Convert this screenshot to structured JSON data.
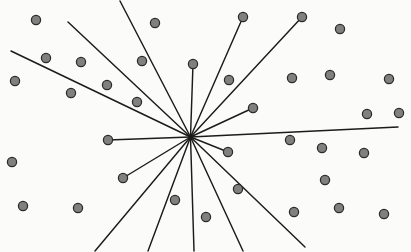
{
  "figure": {
    "type": "scatter-with-radial-lines",
    "width": 411,
    "height": 252,
    "background_color": "#fbfbfa",
    "dot_fill_color": "#808080",
    "dot_stroke_color": "#2b2b2b",
    "line_color": "#1b1b1b",
    "line_width": 1.45,
    "dot_radius": 4.6
  },
  "chart_data": {
    "type": "scatter",
    "title": "",
    "xlabel": "",
    "ylabel": "",
    "xlim": [
      0,
      411
    ],
    "ylim": [
      0,
      252
    ],
    "grid": false,
    "legend": null,
    "annotations": [],
    "hub": {
      "x": 190.5,
      "y": 137.0,
      "label": "convergence-point"
    },
    "points": [
      {
        "x": 36,
        "y": 20
      },
      {
        "x": 155,
        "y": 23
      },
      {
        "x": 243,
        "y": 17
      },
      {
        "x": 302,
        "y": 17
      },
      {
        "x": 340,
        "y": 29
      },
      {
        "x": 46,
        "y": 58
      },
      {
        "x": 81,
        "y": 62
      },
      {
        "x": 142,
        "y": 61
      },
      {
        "x": 15,
        "y": 81
      },
      {
        "x": 71,
        "y": 93
      },
      {
        "x": 107,
        "y": 85
      },
      {
        "x": 229,
        "y": 80
      },
      {
        "x": 292,
        "y": 78
      },
      {
        "x": 330,
        "y": 75
      },
      {
        "x": 389,
        "y": 79
      },
      {
        "x": 137,
        "y": 102
      },
      {
        "x": 193,
        "y": 64
      },
      {
        "x": 253,
        "y": 108
      },
      {
        "x": 367,
        "y": 114
      },
      {
        "x": 399,
        "y": 113
      },
      {
        "x": 108,
        "y": 140
      },
      {
        "x": 290,
        "y": 140
      },
      {
        "x": 322,
        "y": 148
      },
      {
        "x": 364,
        "y": 153
      },
      {
        "x": 228,
        "y": 152
      },
      {
        "x": 12,
        "y": 162
      },
      {
        "x": 123,
        "y": 178
      },
      {
        "x": 238,
        "y": 189
      },
      {
        "x": 325,
        "y": 180
      },
      {
        "x": 23,
        "y": 206
      },
      {
        "x": 78,
        "y": 208
      },
      {
        "x": 175,
        "y": 200
      },
      {
        "x": 206,
        "y": 217
      },
      {
        "x": 294,
        "y": 212
      },
      {
        "x": 339,
        "y": 208
      },
      {
        "x": 384,
        "y": 214
      }
    ],
    "lines": [
      {
        "name": "spoke-nw-edge-left",
        "x1": 190.5,
        "y1": 137.0,
        "x2": 11,
        "y2": 51,
        "terminates_at_dot": false
      },
      {
        "name": "spoke-nw-long",
        "x1": 190.5,
        "y1": 137.0,
        "x2": 68,
        "y2": 22,
        "terminates_at_dot": false
      },
      {
        "name": "spoke-n-steep",
        "x1": 190.5,
        "y1": 137.0,
        "x2": 120,
        "y2": 1,
        "terminates_at_dot": false
      },
      {
        "name": "spoke-n-vertical",
        "x1": 190.5,
        "y1": 137.0,
        "x2": 193,
        "y2": 64,
        "terminates_at_dot": true
      },
      {
        "name": "spoke-ne-to-dot-a",
        "x1": 190.5,
        "y1": 137.0,
        "x2": 243,
        "y2": 17,
        "terminates_at_dot": true
      },
      {
        "name": "spoke-ne-to-dot-b",
        "x1": 190.5,
        "y1": 137.0,
        "x2": 302,
        "y2": 17,
        "terminates_at_dot": true
      },
      {
        "name": "spoke-ene-to-dot",
        "x1": 190.5,
        "y1": 137.0,
        "x2": 253,
        "y2": 108,
        "terminates_at_dot": true
      },
      {
        "name": "spoke-e-long",
        "x1": 190.5,
        "y1": 137.0,
        "x2": 398,
        "y2": 127,
        "terminates_at_dot": false
      },
      {
        "name": "spoke-w-to-dot",
        "x1": 190.5,
        "y1": 137.0,
        "x2": 108,
        "y2": 140,
        "terminates_at_dot": true
      },
      {
        "name": "spoke-ese-to-dot",
        "x1": 190.5,
        "y1": 137.0,
        "x2": 228,
        "y2": 152,
        "terminates_at_dot": true
      },
      {
        "name": "spoke-wsw-to-dot",
        "x1": 190.5,
        "y1": 137.0,
        "x2": 123,
        "y2": 178,
        "terminates_at_dot": true
      },
      {
        "name": "spoke-sw-edge",
        "x1": 190.5,
        "y1": 137.0,
        "x2": 95,
        "y2": 251,
        "terminates_at_dot": false
      },
      {
        "name": "spoke-ssw-edge",
        "x1": 190.5,
        "y1": 137.0,
        "x2": 148,
        "y2": 251,
        "terminates_at_dot": false
      },
      {
        "name": "spoke-s-vertical",
        "x1": 190.5,
        "y1": 137.0,
        "x2": 194,
        "y2": 251,
        "terminates_at_dot": false
      },
      {
        "name": "spoke-sse-edge",
        "x1": 190.5,
        "y1": 137.0,
        "x2": 243,
        "y2": 251,
        "terminates_at_dot": false
      },
      {
        "name": "spoke-se-edge",
        "x1": 190.5,
        "y1": 137.0,
        "x2": 305,
        "y2": 247,
        "terminates_at_dot": false
      }
    ]
  }
}
